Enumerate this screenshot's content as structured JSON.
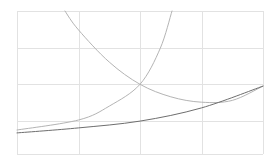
{
  "chart_data": {
    "type": "line",
    "title": "",
    "xlabel": "",
    "ylabel": "",
    "xlim": [
      0,
      4
    ],
    "ylim": [
      0,
      4
    ],
    "grid": true,
    "x_gridlines": [
      0,
      1,
      2,
      3,
      4
    ],
    "y_gridlines": [
      0,
      0.92,
      1.95,
      2.96,
      4
    ],
    "legend": null,
    "series": [
      {
        "name": "rising-steep",
        "color": "#b4b4b4",
        "points": [
          [
            0,
            0.67
          ],
          [
            1,
            0.95
          ],
          [
            1.5,
            1.34
          ],
          [
            2,
            1.95
          ],
          [
            2.33,
            2.96
          ],
          [
            2.52,
            4.0
          ]
        ]
      },
      {
        "name": "decreasing",
        "color": "#b4b4b4",
        "points": [
          [
            0.78,
            4.0
          ],
          [
            1,
            3.47
          ],
          [
            1.5,
            2.57
          ],
          [
            2,
            1.95
          ],
          [
            2.5,
            1.6
          ],
          [
            3,
            1.45
          ],
          [
            3.5,
            1.5
          ],
          [
            4,
            1.9
          ]
        ]
      },
      {
        "name": "rising-slow",
        "color": "#6e6e6e",
        "points": [
          [
            0,
            0.59
          ],
          [
            1,
            0.73
          ],
          [
            2,
            0.92
          ],
          [
            3,
            1.29
          ],
          [
            4,
            1.9
          ]
        ]
      }
    ]
  }
}
